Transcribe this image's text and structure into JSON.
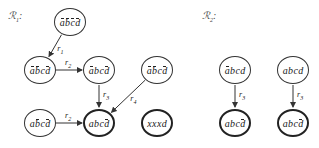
{
  "relations": [
    {
      "id": "R1",
      "label": "ℛ",
      "sub": "1",
      "suffix": ":"
    },
    {
      "id": "R2",
      "label": "ℛ",
      "sub": "2",
      "suffix": ":"
    }
  ],
  "nodes": [
    {
      "id": "n1",
      "group": "R1",
      "x": 70,
      "y": 22,
      "bold": false,
      "letters": [
        {
          "c": "a",
          "bar": true
        },
        {
          "c": "b",
          "bar": true
        },
        {
          "c": "c",
          "bar": true
        },
        {
          "c": "d",
          "bar": true
        }
      ]
    },
    {
      "id": "n2",
      "group": "R1",
      "x": 40,
      "y": 70,
      "bold": false,
      "letters": [
        {
          "c": "a",
          "bar": true
        },
        {
          "c": "b",
          "bar": true
        },
        {
          "c": "c",
          "bar": false
        },
        {
          "c": "d",
          "bar": true
        }
      ]
    },
    {
      "id": "n3",
      "group": "R1",
      "x": 99,
      "y": 70,
      "bold": false,
      "letters": [
        {
          "c": "a",
          "bar": true
        },
        {
          "c": "b",
          "bar": false
        },
        {
          "c": "c",
          "bar": false
        },
        {
          "c": "d",
          "bar": true
        }
      ]
    },
    {
      "id": "n4",
      "group": "R1",
      "x": 157,
      "y": 70,
      "bold": false,
      "letters": [
        {
          "c": "a",
          "bar": true
        },
        {
          "c": "b",
          "bar": true
        },
        {
          "c": "c",
          "bar": false
        },
        {
          "c": "d",
          "bar": true
        }
      ]
    },
    {
      "id": "n5",
      "group": "R1",
      "x": 40,
      "y": 123,
      "bold": false,
      "letters": [
        {
          "c": "a",
          "bar": false
        },
        {
          "c": "b",
          "bar": true
        },
        {
          "c": "c",
          "bar": false
        },
        {
          "c": "d",
          "bar": true
        }
      ]
    },
    {
      "id": "n6",
      "group": "R1",
      "x": 99,
      "y": 123,
      "bold": true,
      "letters": [
        {
          "c": "a",
          "bar": false
        },
        {
          "c": "b",
          "bar": false
        },
        {
          "c": "c",
          "bar": false
        },
        {
          "c": "d",
          "bar": true
        }
      ]
    },
    {
      "id": "n7",
      "group": "R1",
      "x": 157,
      "y": 123,
      "bold": true,
      "letters": [
        {
          "c": "x",
          "bar": false
        },
        {
          "c": "x",
          "bar": false
        },
        {
          "c": "x",
          "bar": false
        },
        {
          "c": "d",
          "bar": false
        }
      ]
    },
    {
      "id": "n8",
      "group": "R2",
      "x": 235,
      "y": 70,
      "bold": false,
      "letters": [
        {
          "c": "a",
          "bar": true
        },
        {
          "c": "b",
          "bar": false
        },
        {
          "c": "c",
          "bar": false
        },
        {
          "c": "d",
          "bar": false
        }
      ]
    },
    {
      "id": "n9",
      "group": "R2",
      "x": 293,
      "y": 70,
      "bold": false,
      "letters": [
        {
          "c": "a",
          "bar": false
        },
        {
          "c": "b",
          "bar": false
        },
        {
          "c": "c",
          "bar": false
        },
        {
          "c": "d",
          "bar": false
        }
      ]
    },
    {
      "id": "n10",
      "group": "R2",
      "x": 235,
      "y": 123,
      "bold": true,
      "letters": [
        {
          "c": "a",
          "bar": false
        },
        {
          "c": "b",
          "bar": false
        },
        {
          "c": "c",
          "bar": false
        },
        {
          "c": "d",
          "bar": true
        }
      ]
    },
    {
      "id": "n11",
      "group": "R2",
      "x": 293,
      "y": 123,
      "bold": true,
      "letters": [
        {
          "c": "a",
          "bar": false
        },
        {
          "c": "b",
          "bar": false
        },
        {
          "c": "c",
          "bar": false
        },
        {
          "c": "d",
          "bar": true
        }
      ]
    }
  ],
  "edges": [
    {
      "from": "n1",
      "to": "n2",
      "label": "r",
      "sub": "1"
    },
    {
      "from": "n2",
      "to": "n3",
      "label": "r",
      "sub": "2"
    },
    {
      "from": "n3",
      "to": "n6",
      "label": "r",
      "sub": "3"
    },
    {
      "from": "n4",
      "to": "n6",
      "label": "r",
      "sub": "4"
    },
    {
      "from": "n5",
      "to": "n6",
      "label": "r",
      "sub": "2"
    },
    {
      "from": "n8",
      "to": "n10",
      "label": "r",
      "sub": "3"
    },
    {
      "from": "n9",
      "to": "n11",
      "label": "r",
      "sub": "3"
    }
  ],
  "colors": {
    "stroke": "#333333",
    "text": "#222222",
    "background": "#ffffff"
  }
}
